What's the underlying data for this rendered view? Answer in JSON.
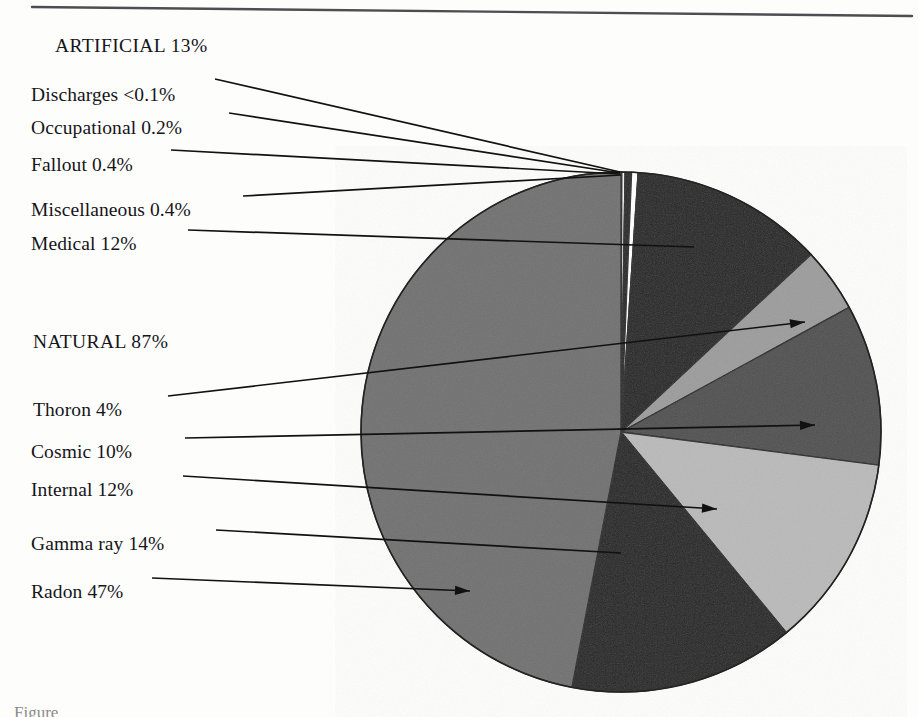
{
  "figure": {
    "caption_partial": "Figure"
  },
  "groups": [
    {
      "id": "artificial",
      "label": "ARTIFICIAL 13%",
      "x": 55,
      "y": 36
    },
    {
      "id": "natural",
      "label": "NATURAL 87%",
      "x": 33,
      "y": 332
    }
  ],
  "labels": [
    {
      "id": "discharges",
      "text": "Discharges <0.1%",
      "x": 31,
      "y": 85
    },
    {
      "id": "occupational",
      "text": "Occupational 0.2%",
      "x": 31,
      "y": 118
    },
    {
      "id": "fallout",
      "text": "Fallout 0.4%",
      "x": 31,
      "y": 155
    },
    {
      "id": "miscellaneous",
      "text": "Miscellaneous 0.4%",
      "x": 31,
      "y": 200
    },
    {
      "id": "medical",
      "text": "Medical 12%",
      "x": 31,
      "y": 234
    },
    {
      "id": "thoron",
      "text": "Thoron 4%",
      "x": 33,
      "y": 400
    },
    {
      "id": "cosmic",
      "text": "Cosmic 10%",
      "x": 31,
      "y": 442
    },
    {
      "id": "internal",
      "text": "Internal 12%",
      "x": 31,
      "y": 480
    },
    {
      "id": "gammaray",
      "text": "Gamma ray 14%",
      "x": 31,
      "y": 534
    },
    {
      "id": "radon",
      "text": "Radon 47%",
      "x": 31,
      "y": 582
    }
  ],
  "chart_data": {
    "type": "pie",
    "xlabel": "",
    "ylabel": "",
    "units": "percent",
    "start_angle_deg": 0,
    "direction": "clockwise",
    "center": {
      "x": 621,
      "y": 432
    },
    "radius": 260,
    "groups": {
      "ARTIFICIAL": 13,
      "NATURAL": 87
    },
    "categories": [
      "Discharges",
      "Occupational",
      "Fallout",
      "Miscellaneous",
      "Medical",
      "Thoron",
      "Cosmic",
      "Internal",
      "Gamma ray",
      "Radon"
    ],
    "values": [
      0.05,
      0.2,
      0.4,
      0.4,
      12,
      4,
      10,
      12,
      14,
      47
    ],
    "value_labels": [
      "<0.1%",
      "0.2%",
      "0.4%",
      "0.4%",
      "12%",
      "4%",
      "10%",
      "12%",
      "14%",
      "47%"
    ],
    "group_of": [
      "ARTIFICIAL",
      "ARTIFICIAL",
      "ARTIFICIAL",
      "ARTIFICIAL",
      "ARTIFICIAL",
      "NATURAL",
      "NATURAL",
      "NATURAL",
      "NATURAL",
      "NATURAL"
    ],
    "colors": [
      "#ffffff",
      "#f2f2f2",
      "#151515",
      "#ffffff",
      "#151515",
      "#9a9a9a",
      "#4a4a4a",
      "#b8b8b8",
      "#151515",
      "#6d6d6d"
    ],
    "legend": "leader-line callouts at left",
    "grid": false
  },
  "leaders": [
    {
      "id": "leader-discharges",
      "x1": 215,
      "y1": 79,
      "x2": 620,
      "y2": 172,
      "arrow": false
    },
    {
      "id": "leader-occupational",
      "x1": 229,
      "y1": 113,
      "x2": 620,
      "y2": 173,
      "arrow": false
    },
    {
      "id": "leader-fallout",
      "x1": 171,
      "y1": 150,
      "x2": 620,
      "y2": 174,
      "arrow": false
    },
    {
      "id": "leader-miscellaneous",
      "x1": 243,
      "y1": 196,
      "x2": 621,
      "y2": 175,
      "arrow": false
    },
    {
      "id": "leader-medical",
      "x1": 188,
      "y1": 230,
      "x2": 694,
      "y2": 247,
      "arrow": false
    },
    {
      "id": "leader-thoron",
      "x1": 168,
      "y1": 396,
      "x2": 805,
      "y2": 322,
      "arrow": true
    },
    {
      "id": "leader-cosmic",
      "x1": 185,
      "y1": 438,
      "x2": 815,
      "y2": 425,
      "arrow": true
    },
    {
      "id": "leader-internal",
      "x1": 183,
      "y1": 476,
      "x2": 717,
      "y2": 509,
      "arrow": true
    },
    {
      "id": "leader-gammaray",
      "x1": 216,
      "y1": 530,
      "x2": 621,
      "y2": 553,
      "arrow": false
    },
    {
      "id": "leader-radon",
      "x1": 152,
      "y1": 578,
      "x2": 470,
      "y2": 591,
      "arrow": true
    }
  ],
  "rules": [
    {
      "id": "top-rule",
      "x1": 32,
      "y1": 7,
      "x2": 912,
      "y2": 16
    }
  ]
}
